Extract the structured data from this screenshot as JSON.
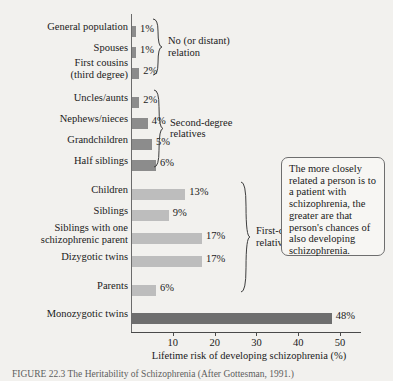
{
  "chart_data": {
    "type": "bar",
    "orientation": "horizontal",
    "title": "",
    "xlabel": "Lifetime risk of developing schizophrenia (%)",
    "ylabel": "",
    "xlim": [
      0,
      55
    ],
    "xticks": [
      10,
      20,
      30,
      40,
      50
    ],
    "grid": false,
    "legend": "none",
    "categories": [
      "General population",
      "Spouses",
      "First cousins\n(third degree)",
      "Uncles/aunts",
      "Nephews/nieces",
      "Grandchildren",
      "Half siblings",
      "Children",
      "Siblings",
      "Siblings with one\nschizophrenic parent",
      "Dizygotic twins",
      "Parents",
      "Monozygotic twins"
    ],
    "values": [
      1,
      1,
      2,
      2,
      4,
      5,
      6,
      13,
      9,
      17,
      17,
      6,
      48
    ],
    "value_labels": [
      "1%",
      "1%",
      "2%",
      "2%",
      "4%",
      "5%",
      "6%",
      "13%",
      "9%",
      "17%",
      "17%",
      "6%",
      "48%"
    ],
    "bar_shades": [
      "mid",
      "mid",
      "mid",
      "mid",
      "mid",
      "mid",
      "mid",
      "light",
      "light",
      "light",
      "light",
      "light",
      "dark"
    ],
    "groups": [
      {
        "label": "No (or distant)\nrelation",
        "from": 0,
        "to": 2
      },
      {
        "label": "Second-degree\nrelatives",
        "from": 3,
        "to": 6
      },
      {
        "label": "First-degree\nrelatives",
        "from": 7,
        "to": 11
      }
    ]
  },
  "colors": {
    "bar_mid": "#8c8c8c",
    "bar_light": "#bdbdbd",
    "bar_dark": "#6e6e6e",
    "axis": "#4a4a4a",
    "background": "#f2f1ee",
    "text": "#1a1a1a"
  },
  "callout": {
    "text": "The more closely related a person is to a patient with schizophrenia, the greater are that person's chances of also developing schizophrenia."
  },
  "caption": {
    "text": "FIGURE 22.3   The Heritability of Schizophrenia  (After Gottesman, 1991.)"
  }
}
